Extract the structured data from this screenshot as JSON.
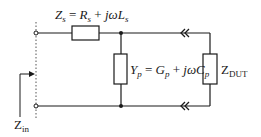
{
  "diagram": {
    "type": "equivalent-circuit",
    "colors": {
      "wire": "#1a1a1a",
      "background": "#ffffff",
      "dotted": "#555555"
    },
    "labels": {
      "zs": {
        "lhs_main": "Z",
        "lhs_sub": "s",
        "eq": " = ",
        "t1_main": "R",
        "t1_sub": "s",
        "plus": " + ",
        "t2_main": "jωL",
        "t2_sub": "s"
      },
      "yp": {
        "lhs_main": "Y",
        "lhs_sub": "p",
        "eq": " = ",
        "t1_main": "G",
        "t1_sub": "p",
        "plus": " + ",
        "t2_main": "jωC",
        "t2_sub": "p"
      },
      "zdut": {
        "main": "Z",
        "sub": "DUT"
      },
      "zin": {
        "main": "Z",
        "sub": "in"
      }
    },
    "components": [
      {
        "id": "Zs",
        "kind": "impedance",
        "orientation": "horizontal"
      },
      {
        "id": "Yp",
        "kind": "admittance",
        "orientation": "vertical"
      },
      {
        "id": "ZDUT",
        "kind": "impedance",
        "orientation": "vertical"
      }
    ],
    "connectors": [
      {
        "id": "top-connector",
        "glyph": "double-chevron-left"
      },
      {
        "id": "bottom-connector",
        "glyph": "double-chevron-left"
      }
    ]
  }
}
